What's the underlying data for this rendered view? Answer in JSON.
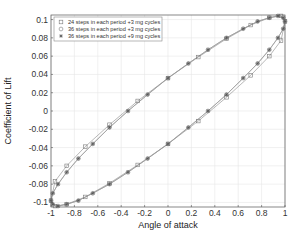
{
  "chart_data": {
    "type": "line",
    "title": "",
    "xlabel": "Angle of attack",
    "ylabel": "Coefficient of Lift",
    "xlim": [
      -1,
      1
    ],
    "ylim": [
      -0.105,
      0.105
    ],
    "xticks": [
      -1,
      -0.8,
      -0.6,
      -0.4,
      -0.2,
      0,
      0.2,
      0.4,
      0.6,
      0.8,
      1
    ],
    "xtick_labels": [
      "-1",
      "-0.8",
      "-0.6",
      "-0.4",
      "-0.2",
      "0",
      "0.2",
      "0.4",
      "0.6",
      "0.8",
      "1"
    ],
    "yticks": [
      -0.1,
      -0.08,
      -0.06,
      -0.04,
      -0.02,
      0,
      0.02,
      0.04,
      0.06,
      0.08,
      0.1
    ],
    "ytick_labels": [
      "-0.1",
      "-0.08",
      "-0.06",
      "-0.04",
      "-0.02",
      "0",
      "0.02",
      "0.04",
      "0.06",
      "0.08",
      "0.1"
    ],
    "grid": true,
    "legend_position": "upper left",
    "loop_model": {
      "description": "hysteresis loop x = cos(t), y = A*cos(t - phi)",
      "amplitude": 0.104,
      "phase_deg": 20
    },
    "series": [
      {
        "name": "24 steps in each period +3 mg cycles",
        "marker": "square",
        "steps": 24,
        "x": [
          1.0,
          0.966,
          0.866,
          0.707,
          0.5,
          0.259,
          0.0,
          -0.259,
          -0.5,
          -0.707,
          -0.866,
          -0.966,
          -1.0,
          -0.966,
          -0.866,
          -0.707,
          -0.5,
          -0.259,
          0.0,
          0.259,
          0.5,
          0.707,
          0.866,
          0.966
        ],
        "y": [
          0.098,
          0.104,
          0.102,
          0.094,
          0.079,
          0.059,
          0.036,
          0.011,
          -0.015,
          -0.039,
          -0.06,
          -0.077,
          -0.098,
          -0.104,
          -0.102,
          -0.094,
          -0.079,
          -0.059,
          -0.036,
          -0.011,
          0.015,
          0.039,
          0.06,
          0.077
        ]
      },
      {
        "name": "36 steps in each period +3 mg cycles",
        "marker": "circle",
        "steps": 36,
        "x": [
          1.0,
          0.985,
          0.94,
          0.866,
          0.766,
          0.643,
          0.5,
          0.342,
          0.174,
          0.0,
          -0.174,
          -0.342,
          -0.5,
          -0.643,
          -0.766,
          -0.866,
          -0.94,
          -0.985,
          -1.0,
          -0.985,
          -0.94,
          -0.866,
          -0.766,
          -0.643,
          -0.5,
          -0.342,
          -0.174,
          0.0,
          0.174,
          0.342,
          0.5,
          0.643,
          0.766,
          0.866,
          0.94,
          0.985
        ],
        "y": [
          0.098,
          0.102,
          0.104,
          0.102,
          0.098,
          0.09,
          0.08,
          0.067,
          0.052,
          0.036,
          0.018,
          0.0,
          -0.018,
          -0.036,
          -0.052,
          -0.067,
          -0.08,
          -0.09,
          -0.098,
          -0.102,
          -0.104,
          -0.102,
          -0.098,
          -0.09,
          -0.08,
          -0.067,
          -0.052,
          -0.036,
          -0.018,
          0.0,
          0.018,
          0.036,
          0.052,
          0.067,
          0.08,
          0.09
        ]
      },
      {
        "name": "36 steps in each period +9 mg cycles",
        "marker": "star",
        "steps": 36,
        "x": [
          1.0,
          0.985,
          0.94,
          0.866,
          0.766,
          0.643,
          0.5,
          0.342,
          0.174,
          0.0,
          -0.174,
          -0.342,
          -0.5,
          -0.643,
          -0.766,
          -0.866,
          -0.94,
          -0.985,
          -1.0,
          -0.985,
          -0.94,
          -0.866,
          -0.766,
          -0.643,
          -0.5,
          -0.342,
          -0.174,
          0.0,
          0.174,
          0.342,
          0.5,
          0.643,
          0.766,
          0.866,
          0.94,
          0.985
        ],
        "y": [
          0.098,
          0.102,
          0.104,
          0.102,
          0.098,
          0.09,
          0.08,
          0.067,
          0.052,
          0.036,
          0.018,
          0.0,
          -0.018,
          -0.036,
          -0.052,
          -0.067,
          -0.08,
          -0.09,
          -0.098,
          -0.102,
          -0.104,
          -0.102,
          -0.098,
          -0.09,
          -0.08,
          -0.067,
          -0.052,
          -0.036,
          -0.018,
          0.0,
          0.018,
          0.036,
          0.052,
          0.067,
          0.08,
          0.09
        ]
      }
    ]
  },
  "style": {
    "line_color": "#9a9a9a",
    "marker_color": "#7a7a7a",
    "grid_color": "#e6e6e6",
    "axis_color": "#555555",
    "legend_border": "#888888"
  },
  "layout": {
    "plot_left": 51,
    "plot_right": 285,
    "plot_top": 15,
    "plot_bottom": 207
  }
}
